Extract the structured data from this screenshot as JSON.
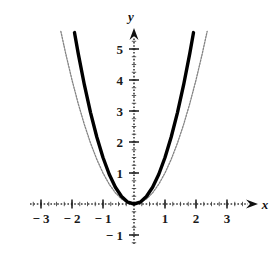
{
  "figure": {
    "title": "",
    "background_color": "#ffffff"
  },
  "axes": {
    "x_label": "x",
    "y_label": "y",
    "x_ticks": [
      {
        "value": -3,
        "label": "− 3"
      },
      {
        "value": -2,
        "label": "− 2"
      },
      {
        "value": -1,
        "label": "− 1"
      },
      {
        "value": 1,
        "label": "1"
      },
      {
        "value": 2,
        "label": "2"
      },
      {
        "value": 3,
        "label": "3"
      }
    ],
    "y_ticks": [
      {
        "value": -1,
        "label": "− 1"
      },
      {
        "value": 1,
        "label": "1"
      },
      {
        "value": 2,
        "label": "2"
      },
      {
        "value": 3,
        "label": "3"
      },
      {
        "value": 4,
        "label": "4"
      },
      {
        "value": 5,
        "label": "5"
      }
    ],
    "minor_tick_step": 0.25,
    "axis_style": "dotted",
    "axis_color": "#3a3a3a",
    "arrowheads": [
      "x-positive",
      "y-positive"
    ]
  },
  "chart_data": {
    "type": "line",
    "title": "",
    "xlabel": "x",
    "ylabel": "y",
    "xlim": [
      -3.6,
      3.6
    ],
    "ylim": [
      -1.8,
      5.9
    ],
    "grid": false,
    "legend": "none",
    "series": [
      {
        "name": "narrow parabola (thick solid)",
        "equation": "y = 1.5x^2",
        "style": "solid-thick-black",
        "color": "#000000",
        "line_width": 3.4,
        "x": [
          -1.92,
          -1.8,
          -1.6,
          -1.4,
          -1.2,
          -1.0,
          -0.8,
          -0.6,
          -0.4,
          -0.2,
          0,
          0.2,
          0.4,
          0.6,
          0.8,
          1.0,
          1.2,
          1.4,
          1.6,
          1.8,
          1.92
        ],
        "values": [
          5.53,
          4.86,
          3.84,
          2.94,
          2.16,
          1.5,
          0.96,
          0.54,
          0.24,
          0.06,
          0,
          0.06,
          0.24,
          0.54,
          0.96,
          1.5,
          2.16,
          2.94,
          3.84,
          4.86,
          5.53
        ]
      },
      {
        "name": "wide parabola (thin hatched)",
        "equation": "y = x^2",
        "style": "dotted-thin-gray",
        "color": "#8d8d8d",
        "line_width": 1.3,
        "x": [
          -2.36,
          -2.2,
          -2.0,
          -1.8,
          -1.6,
          -1.4,
          -1.2,
          -1.0,
          -0.8,
          -0.6,
          -0.4,
          -0.2,
          0,
          0.2,
          0.4,
          0.6,
          0.8,
          1.0,
          1.2,
          1.4,
          1.6,
          1.8,
          2.0,
          2.2,
          2.36
        ],
        "values": [
          5.57,
          4.84,
          4.0,
          3.24,
          2.56,
          1.96,
          1.44,
          1.0,
          0.64,
          0.36,
          0.16,
          0.04,
          0,
          0.04,
          0.16,
          0.36,
          0.64,
          1.0,
          1.44,
          1.96,
          2.56,
          3.24,
          4.0,
          4.84,
          5.57
        ]
      }
    ]
  }
}
